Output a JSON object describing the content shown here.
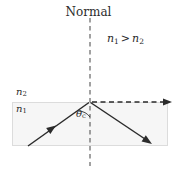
{
  "figure": {
    "type": "total-internal-reflection-diagram",
    "background_color": "#ffffff",
    "medium_fill_color": "#f6f6f6",
    "medium_border_color": "#d8d8d8",
    "line_color": "#2b2b2b",
    "dash_color": "#555555"
  },
  "labels": {
    "normal": "Normal",
    "index_compare": "n1 > n2",
    "index_compare_parts": {
      "left": "n",
      "left_sub": "1",
      "operator": ">",
      "right": "n",
      "right_sub": "2"
    },
    "upper_medium": "n2",
    "upper_medium_parts": {
      "base": "n",
      "sub": "2"
    },
    "lower_medium": "n1",
    "lower_medium_parts": {
      "base": "n",
      "sub": "1"
    },
    "critical_angle": "θc",
    "critical_angle_parts": {
      "base": "θ",
      "sub": "c"
    }
  },
  "geometry": {
    "interface_y": 102,
    "vertex": {
      "x": 90,
      "y": 102
    },
    "medium_box": {
      "x": 12,
      "y": 102,
      "width": 156,
      "height": 44
    },
    "normal_line": {
      "x": 90,
      "y_top": 18,
      "y_bottom": 166,
      "style": "dashed"
    },
    "incident_ray": {
      "from": {
        "x": 28,
        "y": 146
      },
      "to": {
        "x": 90,
        "y": 102
      },
      "style": "solid",
      "arrow_at": {
        "x": 52,
        "y": 129
      }
    },
    "reflected_ray": {
      "from": {
        "x": 90,
        "y": 102
      },
      "to": {
        "x": 152,
        "y": 144
      },
      "style": "solid",
      "arrow_at_end": true
    },
    "refracted_ray": {
      "from": {
        "x": 92,
        "y": 102
      },
      "to": {
        "x": 172,
        "y": 102
      },
      "style": "dashed",
      "arrow_at_end": true
    }
  }
}
